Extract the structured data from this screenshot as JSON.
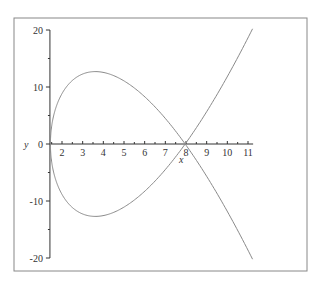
{
  "chart_data": {
    "type": "line",
    "title": "",
    "xlabel": "x",
    "ylabel": "y",
    "xlim": [
      1.44,
      11.2
    ],
    "ylim": [
      -20,
      20
    ],
    "grid": false,
    "legend": null,
    "x_ticks": [
      2,
      3,
      4,
      5,
      6,
      7,
      8,
      9,
      10,
      11
    ],
    "y_ticks": [
      -20,
      -10,
      0,
      10,
      20
    ],
    "series": [
      {
        "name": "parametric curve (nodal cubic)",
        "description": "Closed loop from x≈1.44 to self-intersection at (8,0), with branches continuing to (11.2, ±20)",
        "points": [
          {
            "x": 11.2,
            "y": -20
          },
          {
            "x": 8.0,
            "y": 0
          },
          {
            "x": 6.5,
            "y": 8
          },
          {
            "x": 3.6,
            "y": 12.7
          },
          {
            "x": 2.0,
            "y": 8.7
          },
          {
            "x": 1.44,
            "y": 0
          },
          {
            "x": 2.0,
            "y": -8.7
          },
          {
            "x": 3.6,
            "y": -12.7
          },
          {
            "x": 6.5,
            "y": -8
          },
          {
            "x": 8.0,
            "y": 0
          },
          {
            "x": 11.2,
            "y": 20
          }
        ],
        "color": "#888888"
      }
    ]
  },
  "labels": {
    "x_axis": "x",
    "y_axis": "y"
  }
}
